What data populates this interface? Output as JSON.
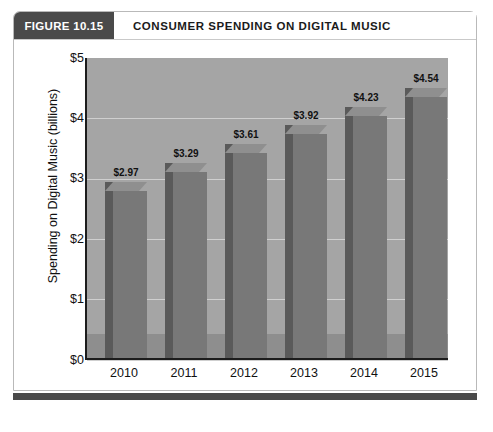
{
  "figure": {
    "number_label": "FIGURE 10.15",
    "title": "CONSUMER SPENDING ON DIGITAL MUSIC"
  },
  "colors": {
    "header_block": "#4a4a4a",
    "plot_background": "#a5a5a5",
    "bar_front": "#787878",
    "bar_side": "#5a5a5a",
    "bar_top": "#8f8f8f",
    "gridline": "#cfcfcf",
    "axis": "#1c1c1c",
    "text": "#111111"
  },
  "chart_data": {
    "type": "bar",
    "title": "CONSUMER SPENDING ON DIGITAL MUSIC",
    "xlabel": "",
    "ylabel": "Spending on Digital Music  (billions)",
    "categories": [
      "2010",
      "2011",
      "2012",
      "2013",
      "2014",
      "2015"
    ],
    "values": [
      2.97,
      3.29,
      3.61,
      3.92,
      4.23,
      4.54
    ],
    "data_labels": [
      "$2.97",
      "$3.29",
      "$3.61",
      "$3.92",
      "$4.23",
      "$4.54"
    ],
    "ylim": [
      0,
      5
    ],
    "yticks": [
      0,
      1,
      2,
      3,
      4,
      5
    ],
    "ytick_labels": [
      "$0",
      "$1",
      "$2",
      "$3",
      "$4",
      "$5"
    ],
    "grid": true,
    "legend": null,
    "style": "3d-column"
  }
}
